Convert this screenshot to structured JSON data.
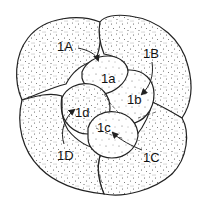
{
  "diagram": {
    "macromeres": [
      {
        "id": "1A",
        "label": "1A"
      },
      {
        "id": "1B",
        "label": "1B"
      },
      {
        "id": "1C",
        "label": "1C"
      },
      {
        "id": "1D",
        "label": "1D"
      }
    ],
    "micromeres": [
      {
        "id": "1a",
        "label": "1a"
      },
      {
        "id": "1b",
        "label": "1b"
      },
      {
        "id": "1c",
        "label": "1c"
      },
      {
        "id": "1d",
        "label": "1d"
      }
    ],
    "colors": {
      "outline": "#222222",
      "stipple": "#555555",
      "background": "#ffffff"
    }
  }
}
